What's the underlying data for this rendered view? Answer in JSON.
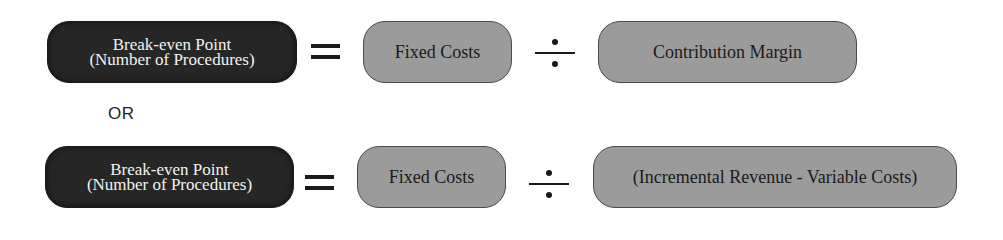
{
  "colors": {
    "dark_box": "#262626",
    "gray_box": "#9b9b9b",
    "border": "#4a4a4a",
    "text_light": "#f2f2f2",
    "text_dark": "#1a1a1a"
  },
  "equations": [
    {
      "lhs": {
        "line1": "Break-even Point",
        "line2": "(Number of Procedures)"
      },
      "operator1": "=",
      "numerator": "Fixed Costs",
      "operator2": "÷",
      "denominator": "Contribution Margin"
    },
    {
      "lhs": {
        "line1": "Break-even Point",
        "line2": "(Number of Procedures)"
      },
      "operator1": "=",
      "numerator": "Fixed Costs",
      "operator2": "÷",
      "denominator": "(Incremental Revenue - Variable Costs)"
    }
  ],
  "separator": "OR"
}
